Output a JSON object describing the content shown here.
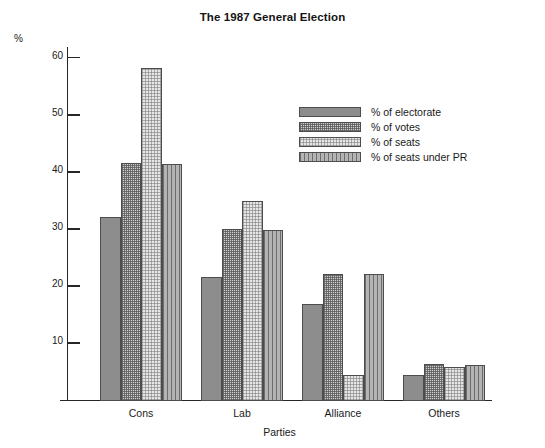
{
  "chart_data": {
    "type": "bar",
    "title": "The 1987 General Election",
    "xlabel": "Parties",
    "ylabel": "%",
    "ylim": [
      0,
      62
    ],
    "yticks": [
      10,
      20,
      30,
      40,
      50,
      60
    ],
    "grid": false,
    "legend_position": "upper-right-inside",
    "categories": [
      "Cons",
      "Lab",
      "Alliance",
      "Others"
    ],
    "series": [
      {
        "name": "% of electorate",
        "pattern": "solid-grey",
        "values": [
          32.2,
          21.8,
          17.0,
          4.5
        ]
      },
      {
        "name": "% of votes",
        "pattern": "dense-speckle",
        "values": [
          41.6,
          30.2,
          22.3,
          6.5
        ]
      },
      {
        "name": "% of seats",
        "pattern": "light-checker",
        "values": [
          58.3,
          35.1,
          4.5,
          6.0
        ]
      },
      {
        "name": "% of seats under PR",
        "pattern": "vertical-lines",
        "values": [
          41.5,
          29.9,
          22.3,
          6.3
        ]
      }
    ]
  },
  "colors": {
    "axis": "#262626",
    "bar_outline": "#4d4d4d",
    "series_1": "#8d8d8d",
    "series_2": "#cfcfcf",
    "series_3": "#e6e6e6",
    "series_4": "#b4b4b4",
    "text": "#1a1a1a",
    "background": "#ffffff"
  }
}
